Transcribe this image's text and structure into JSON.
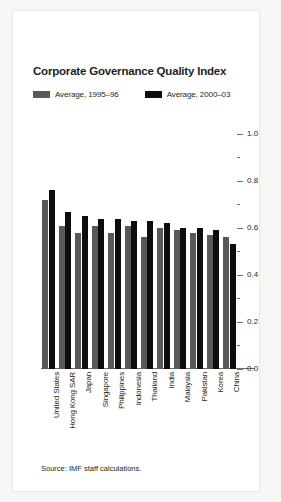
{
  "chart_data": {
    "type": "bar",
    "title": "Corporate Governance Quality Index",
    "xlabel": "",
    "ylabel": "",
    "ylim": [
      0.0,
      1.0
    ],
    "yticks": [
      {
        "value": 1.0,
        "label": "1.0",
        "major": true
      },
      {
        "value": 0.9,
        "label": "",
        "major": false
      },
      {
        "value": 0.8,
        "label": "0.8",
        "major": true
      },
      {
        "value": 0.7,
        "label": "",
        "major": false
      },
      {
        "value": 0.6,
        "label": "0.6",
        "major": true
      },
      {
        "value": 0.5,
        "label": "",
        "major": false
      },
      {
        "value": 0.4,
        "label": "0.4",
        "major": true
      },
      {
        "value": 0.3,
        "label": "",
        "major": false
      },
      {
        "value": 0.2,
        "label": "0.2",
        "major": true
      },
      {
        "value": 0.1,
        "label": "",
        "major": false
      },
      {
        "value": 0.0,
        "label": "0.0",
        "major": true
      }
    ],
    "grid": false,
    "legend_position": "top-left",
    "categories": [
      "United States",
      "Hong Kong SAR",
      "Japan",
      "Singapore",
      "Philippines",
      "Indonesia",
      "Thailand",
      "India",
      "Malaysia",
      "Pakistan",
      "Korea",
      "China"
    ],
    "series": [
      {
        "name": "Average, 1995–96",
        "color": "#58595b",
        "values": [
          0.72,
          0.61,
          0.58,
          0.61,
          0.58,
          0.61,
          0.56,
          0.6,
          0.59,
          0.58,
          0.57,
          0.56
        ]
      },
      {
        "name": "Average, 2000–03",
        "color": "#0d0d0d",
        "values": [
          0.76,
          0.67,
          0.65,
          0.64,
          0.64,
          0.63,
          0.63,
          0.62,
          0.6,
          0.6,
          0.59,
          0.53
        ]
      }
    ],
    "source": "Source: IMF staff calculations."
  },
  "legend": {
    "entries": [
      {
        "label": "Average, 1995–96"
      },
      {
        "label": "Average, 2000–03"
      }
    ]
  }
}
